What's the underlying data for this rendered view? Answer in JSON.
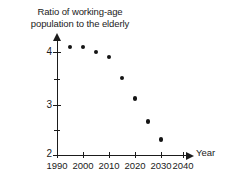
{
  "chart_data": {
    "type": "scatter",
    "title": "Ratio of working-age\npopulation to the elderly",
    "xlabel": "Year",
    "ylabel": "",
    "xlim": [
      1990,
      2040
    ],
    "ylim": [
      2,
      4.35
    ],
    "grid": false,
    "legend": null,
    "x": [
      1995,
      2000,
      2005,
      2010,
      2015,
      2020,
      2025,
      2030
    ],
    "values": [
      4.1,
      4.1,
      4.0,
      3.9,
      3.5,
      3.1,
      2.65,
      2.3
    ],
    "xticks": [
      1990,
      2000,
      2010,
      2020,
      2030,
      2040
    ],
    "xtick_labels": [
      "1990",
      "2000",
      "2010",
      "2020",
      "2030",
      "2040"
    ],
    "yticks": [
      2,
      2.5,
      3,
      3.5,
      4
    ],
    "ytick_labels": [
      "2",
      "",
      "3",
      "",
      "4"
    ],
    "ytick_major": [
      2,
      3,
      4
    ],
    "marker": "filled-circle",
    "marker_color": "#141414",
    "axis_color": "#1b1b1b"
  }
}
